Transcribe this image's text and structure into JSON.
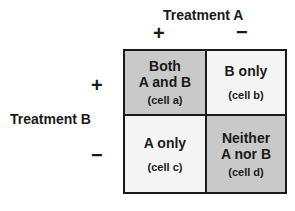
{
  "diagram": {
    "treatment_a": {
      "label": "Treatment A",
      "plus": "+",
      "minus": "−"
    },
    "treatment_b": {
      "label": "Treatment B",
      "plus": "+",
      "minus": "−"
    },
    "colors": {
      "shaded": "#c9c9c9",
      "unshaded": "#f4f4f4",
      "border": "#1a1a1a"
    },
    "cells": {
      "a": {
        "line1": "Both",
        "line2": "A and B",
        "sub": "(cell a)",
        "shaded": true
      },
      "b": {
        "line1": "B only",
        "sub": "(cell b)",
        "shaded": false
      },
      "c": {
        "line1": "A only",
        "sub": "(cell c)",
        "shaded": false
      },
      "d": {
        "line1": "Neither",
        "line2": "A nor B",
        "sub": "(cell d)",
        "shaded": true
      }
    }
  }
}
